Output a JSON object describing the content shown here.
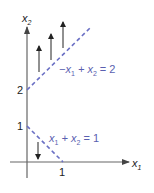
{
  "diagram": {
    "axes": {
      "x_label": "x",
      "x_sub": "1",
      "y_label": "x",
      "y_sub": "2"
    },
    "ticks": {
      "y_2": "2",
      "y_1": "1",
      "x_1": "1"
    },
    "constraints": [
      {
        "name": "upper",
        "eq_prefix": "−x",
        "eq_sub1": "1",
        "eq_mid": " + x",
        "eq_sub2": "2",
        "eq_suffix": " = 2",
        "direction": "up",
        "arrow_count": 3
      },
      {
        "name": "lower",
        "eq_prefix": "x",
        "eq_sub1": "1",
        "eq_mid": " + x",
        "eq_sub2": "2",
        "eq_suffix": " = 1",
        "direction": "down",
        "arrow_count": 1
      }
    ],
    "colors": {
      "axis": "#555555",
      "dashed_line": "#6a6fc4",
      "equation_text": "#5a5fb0",
      "arrow": "#222222"
    }
  }
}
